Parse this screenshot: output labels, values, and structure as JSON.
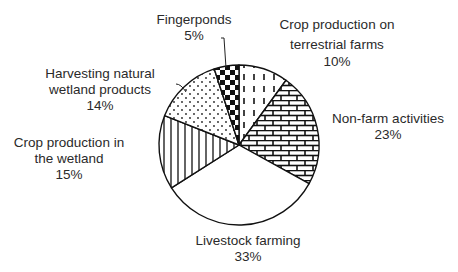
{
  "chart_data": {
    "type": "pie",
    "title": "",
    "center": [
      239,
      145
    ],
    "radius": 80,
    "start_angle_deg": 0,
    "direction": "clockwise",
    "slices": [
      {
        "label": "Crop production on terrestrial farms",
        "lines": [
          "Crop production on",
          "terrestrial farms"
        ],
        "value": 10,
        "value_label": "10%",
        "pattern": "dashes"
      },
      {
        "label": "Non-farm activities",
        "lines": [
          "Non-farm activities"
        ],
        "value": 23,
        "value_label": "23%",
        "pattern": "bricks"
      },
      {
        "label": "Livestock farming",
        "lines": [
          "Livestock farming"
        ],
        "value": 33,
        "value_label": "33%",
        "pattern": "blank"
      },
      {
        "label": "Crop production in the wetland",
        "lines": [
          "Crop production in",
          "the wetland"
        ],
        "value": 15,
        "value_label": "15%",
        "pattern": "vertical-lines"
      },
      {
        "label": "Harvesting natural wetland products",
        "lines": [
          "Harvesting natural",
          "wetland products"
        ],
        "value": 14,
        "value_label": "14%",
        "pattern": "dots"
      },
      {
        "label": "Fingerponds",
        "lines": [
          "Fingerponds"
        ],
        "value": 5,
        "value_label": "5%",
        "pattern": "checker"
      }
    ],
    "legend": "none (direct labels)",
    "colors": {
      "stroke": "#111111",
      "fill": "#ffffff",
      "text": "#2a2a2a"
    }
  },
  "labels": {
    "crop_terrestrial": {
      "line1": "Crop production on",
      "line2": "terrestrial farms",
      "pct": "10%"
    },
    "non_farm": {
      "line1": "Non-farm activities",
      "pct": "23%"
    },
    "livestock": {
      "line1": "Livestock farming",
      "pct": "33%"
    },
    "crop_wetland": {
      "line1": "Crop production in",
      "line2": "the wetland",
      "pct": "15%"
    },
    "harvesting": {
      "line1": "Harvesting natural",
      "line2": "wetland products",
      "pct": "14%"
    },
    "fingerponds": {
      "line1": "Fingerponds",
      "pct": "5%"
    }
  }
}
